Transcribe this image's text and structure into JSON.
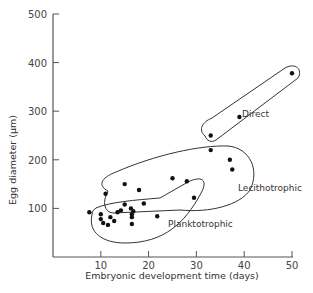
{
  "chart_data": {
    "type": "scatter",
    "title": "",
    "xlabel": "Embryonic development time (days)",
    "ylabel": "Egg diameter (μm)",
    "xlim": [
      0,
      50
    ],
    "ylim": [
      0,
      500
    ],
    "xticks": [
      10,
      20,
      30,
      40,
      50
    ],
    "yticks": [
      100,
      200,
      300,
      400,
      500
    ],
    "grid": false,
    "legend": "none (groups labeled inline with enclosing outlines)",
    "series": [
      {
        "name": "Planktotrophic",
        "points": [
          [
            7.6,
            92
          ],
          [
            10,
            88
          ],
          [
            10,
            78
          ],
          [
            10.5,
            70
          ],
          [
            12,
            82
          ],
          [
            12.8,
            74
          ],
          [
            13.5,
            92
          ],
          [
            14.2,
            96
          ],
          [
            16.3,
            100
          ],
          [
            16.5,
            88
          ],
          [
            16.8,
            94
          ],
          [
            16.5,
            82
          ],
          [
            16.5,
            68
          ],
          [
            19,
            110
          ],
          [
            21.8,
            84
          ],
          [
            15,
            108
          ],
          [
            11.5,
            66
          ]
        ]
      },
      {
        "name": "Lecithotrophic",
        "points": [
          [
            11,
            130
          ],
          [
            18,
            138
          ],
          [
            25,
            162
          ],
          [
            28,
            156
          ],
          [
            29.5,
            122
          ],
          [
            33,
            220
          ],
          [
            37,
            200
          ],
          [
            37.5,
            180
          ],
          [
            15,
            150
          ]
        ]
      },
      {
        "name": "Direct",
        "points": [
          [
            33,
            250
          ],
          [
            39,
            288
          ],
          [
            50,
            378
          ]
        ]
      }
    ],
    "annotations": [
      "Planktotrophic",
      "Lecithotrophic",
      "Direct"
    ]
  },
  "labels": {
    "xlabel": "Embryonic development time (days)",
    "ylabel": "Egg diameter (μm)",
    "groups": {
      "planktotrophic": "Planktotrophic",
      "lecithotrophic": "Lecithotrophic",
      "direct": "Direct"
    }
  }
}
